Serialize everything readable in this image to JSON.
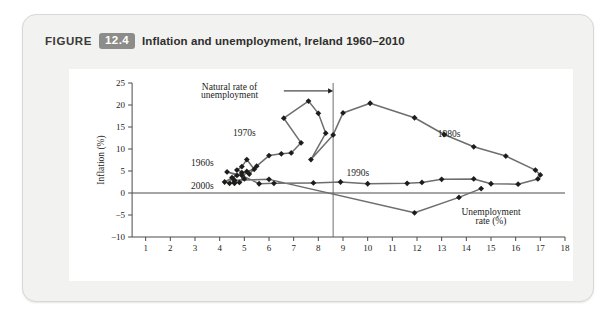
{
  "figure": {
    "label_word": "FIGURE",
    "number": "12.4",
    "title": "Inflation and unemployment, Ireland 1960–2010"
  },
  "chart_data": {
    "type": "line",
    "title": "Inflation and unemployment, Ireland 1960–2010",
    "xlabel": "Unemployment rate (%)",
    "ylabel": "Inflation (%)",
    "xlim": [
      0,
      18
    ],
    "ylim": [
      -10,
      25
    ],
    "xticks": [
      0,
      1,
      2,
      3,
      4,
      5,
      6,
      7,
      8,
      9,
      10,
      11,
      12,
      13,
      14,
      15,
      16,
      17,
      18
    ],
    "xtick_labels": [
      "",
      "1",
      "2",
      "3",
      "4",
      "5",
      "6",
      "7",
      "8",
      "9",
      "10",
      "11",
      "12",
      "13",
      "14",
      "15",
      "16",
      "17",
      "18"
    ],
    "yticks": [
      -10,
      -5,
      0,
      5,
      10,
      15,
      20,
      25
    ],
    "ytick_labels": [
      "−10",
      "−5",
      "0",
      "5",
      "10",
      "15",
      "20",
      "25"
    ],
    "grid": false,
    "legend": "none",
    "marker": "diamond",
    "series": [
      {
        "name": "Ireland inflation vs unemployment 1960–2010",
        "points": [
          [
            4.6,
            2.2
          ],
          [
            4.2,
            2.5
          ],
          [
            4.9,
            4.6
          ],
          [
            5.0,
            3.2
          ],
          [
            4.8,
            2.4
          ],
          [
            5.1,
            4.9
          ],
          [
            5.4,
            5.4
          ],
          [
            5.1,
            7.6
          ],
          [
            4.9,
            6.0
          ],
          [
            4.7,
            5.2
          ],
          [
            5.2,
            4.3
          ],
          [
            5.5,
            6.1
          ],
          [
            6.0,
            8.5
          ],
          [
            6.5,
            8.9
          ],
          [
            6.9,
            9.1
          ],
          [
            7.3,
            11.4
          ],
          [
            6.6,
            17.0
          ],
          [
            7.6,
            20.9
          ],
          [
            8.0,
            18.1
          ],
          [
            8.3,
            13.6
          ],
          [
            7.7,
            7.6
          ],
          [
            8.6,
            13.2
          ],
          [
            9.0,
            18.2
          ],
          [
            10.1,
            20.4
          ],
          [
            11.9,
            17.1
          ],
          [
            13.1,
            13.3
          ],
          [
            14.3,
            10.5
          ],
          [
            15.6,
            8.4
          ],
          [
            16.8,
            5.2
          ],
          [
            17.0,
            4.1
          ],
          [
            16.9,
            3.2
          ],
          [
            16.1,
            2.0
          ],
          [
            15.0,
            2.1
          ],
          [
            14.3,
            3.2
          ],
          [
            13.0,
            3.1
          ],
          [
            12.2,
            2.4
          ],
          [
            11.6,
            2.2
          ],
          [
            10.0,
            2.1
          ],
          [
            8.9,
            2.5
          ],
          [
            7.8,
            2.3
          ],
          [
            6.2,
            2.2
          ],
          [
            5.6,
            2.1
          ],
          [
            4.9,
            4.0
          ],
          [
            4.3,
            4.8
          ],
          [
            4.7,
            4.0
          ],
          [
            4.5,
            3.5
          ],
          [
            4.4,
            2.2
          ],
          [
            4.6,
            2.5
          ],
          [
            4.6,
            2.9
          ],
          [
            6.0,
            3.1
          ],
          [
            11.9,
            -4.5
          ],
          [
            13.7,
            -1.0
          ],
          [
            14.6,
            1.0
          ]
        ]
      }
    ],
    "annotations": [
      {
        "text": "Natural rate of",
        "x": 4.4,
        "y": 24.0
      },
      {
        "text": "unemployment",
        "x": 4.4,
        "y": 22.3
      },
      {
        "text": "1970s",
        "x": 5.0,
        "y": 13.6
      },
      {
        "text": "1960s",
        "x": 3.3,
        "y": 6.8
      },
      {
        "text": "2000s",
        "x": 3.3,
        "y": 1.6
      },
      {
        "text": "1980s",
        "x": 13.3,
        "y": 13.5
      },
      {
        "text": "1990s",
        "x": 9.6,
        "y": 4.6
      }
    ],
    "reference_lines": [
      {
        "orientation": "vertical",
        "value": 8.6,
        "label": "Natural rate of unemployment"
      },
      {
        "orientation": "horizontal",
        "value": 0,
        "label": "zero inflation"
      }
    ]
  },
  "style": {
    "series_color": "#6e6e6e",
    "marker_color": "#1d1d1b",
    "axis_color": "#4a4a48",
    "badge_color": "#8c8c88",
    "card_background": "#f2f2f0",
    "panel_background": "#ffffff"
  }
}
